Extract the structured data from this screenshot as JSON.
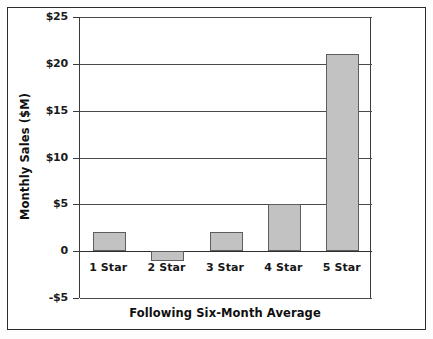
{
  "chart_data": {
    "type": "bar",
    "title": "",
    "categories": [
      "1 Star",
      "2 Star",
      "3 Star",
      "4 Star",
      "5 Star"
    ],
    "values": [
      2,
      -1,
      2,
      5,
      21
    ],
    "xlabel": "Following Six-Month Average",
    "ylabel": "Monthly Sales ($M)",
    "ylim": [
      -5,
      25
    ],
    "ytick_values": [
      25,
      20,
      15,
      10,
      5,
      0,
      -5
    ],
    "ytick_labels": [
      "$25",
      "$20",
      "$15",
      "$10",
      "$5",
      "0",
      "-$5"
    ],
    "grid": true,
    "legend": "none",
    "bar_fill_color": "#c2c2c2",
    "bar_edge_color": "#5d5d5d",
    "axis_color": "#3a3a3a",
    "frame_color": "#2b2b2b"
  }
}
